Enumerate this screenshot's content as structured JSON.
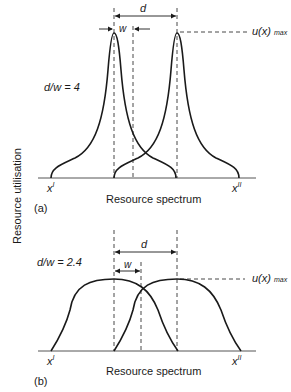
{
  "y_axis_label": "Resource utilisation",
  "panels": [
    {
      "id": "a",
      "panel_label": "(a)",
      "ratio_label": "d/w = 4",
      "x_axis_label": "Resource spectrum",
      "d_label": "d",
      "w_label": "w",
      "umax_label": "u(x)",
      "umax_sub": "max",
      "x_left": "x",
      "x_left_sup": "I",
      "x_right": "x",
      "x_right_sup": "II"
    },
    {
      "id": "b",
      "panel_label": "(b)",
      "ratio_label": "d/w = 2.4",
      "x_axis_label": "Resource spectrum",
      "d_label": "d",
      "w_label": "w",
      "umax_label": "u(x)",
      "umax_sub": "max",
      "x_left": "x",
      "x_left_sup": "I",
      "x_right": "x",
      "x_right_sup": "II"
    }
  ]
}
